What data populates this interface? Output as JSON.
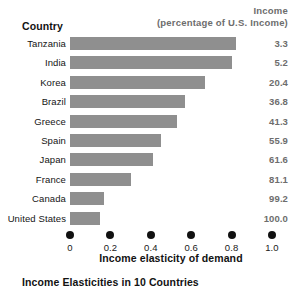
{
  "header": {
    "country_label": "Country",
    "income_line1": "Income",
    "income_line2": "(percentage of U.S. Income)"
  },
  "axis_title": "Income elasticity of demand",
  "caption": "Income Elasticities in 10 Countries",
  "chart_data": {
    "type": "bar",
    "orientation": "horizontal",
    "title": "Income Elasticities in 10 Countries",
    "xlabel": "Income elasticity of demand",
    "ylabel": "Country",
    "xlim": [
      0,
      1.0
    ],
    "xticks": [
      "0",
      "0.2",
      "0.4",
      "0.6",
      "0.8",
      "1.0"
    ],
    "xtick_values": [
      0,
      0.2,
      0.4,
      0.6,
      0.8,
      1.0
    ],
    "grid": false,
    "legend": "none",
    "bar_color": "#8f8f8f",
    "value_column_header": "Income (percentage of U.S. Income)",
    "categories": [
      "Tanzania",
      "India",
      "Korea",
      "Brazil",
      "Greece",
      "Spain",
      "Japan",
      "France",
      "Canada",
      "United States"
    ],
    "values": [
      0.82,
      0.8,
      0.67,
      0.57,
      0.53,
      0.45,
      0.41,
      0.3,
      0.17,
      0.15
    ],
    "income_percent_of_us": [
      "3.3",
      "5.2",
      "20.4",
      "36.8",
      "41.3",
      "55.9",
      "61.6",
      "81.1",
      "99.2",
      "100.0"
    ],
    "rows": [
      {
        "country": "Tanzania",
        "elasticity": 0.82,
        "income": "3.3"
      },
      {
        "country": "India",
        "elasticity": 0.8,
        "income": "5.2"
      },
      {
        "country": "Korea",
        "elasticity": 0.67,
        "income": "20.4"
      },
      {
        "country": "Brazil",
        "elasticity": 0.57,
        "income": "36.8"
      },
      {
        "country": "Greece",
        "elasticity": 0.53,
        "income": "41.3"
      },
      {
        "country": "Spain",
        "elasticity": 0.45,
        "income": "55.9"
      },
      {
        "country": "Japan",
        "elasticity": 0.41,
        "income": "61.6"
      },
      {
        "country": "France",
        "elasticity": 0.3,
        "income": "81.1"
      },
      {
        "country": "Canada",
        "elasticity": 0.17,
        "income": "99.2"
      },
      {
        "country": "United States",
        "elasticity": 0.15,
        "income": "100.0"
      }
    ]
  }
}
